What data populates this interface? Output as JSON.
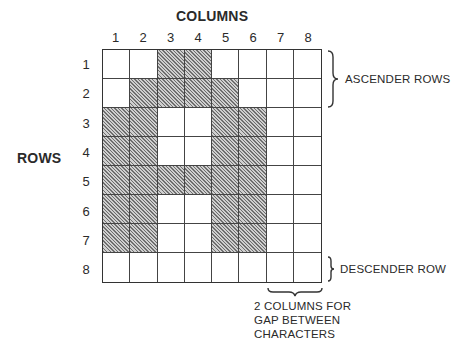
{
  "diagram": {
    "columns_title": "COLUMNS",
    "rows_title": "ROWS",
    "column_labels": [
      "1",
      "2",
      "3",
      "4",
      "5",
      "6",
      "7",
      "8"
    ],
    "row_labels": [
      "1",
      "2",
      "3",
      "4",
      "5",
      "6",
      "7",
      "8"
    ],
    "grid": {
      "rows": 8,
      "cols": 8,
      "filled_cells": [
        [
          0,
          0,
          1,
          1,
          0,
          0,
          0,
          0
        ],
        [
          0,
          1,
          1,
          1,
          1,
          0,
          0,
          0
        ],
        [
          1,
          1,
          0,
          0,
          1,
          1,
          0,
          0
        ],
        [
          1,
          1,
          0,
          0,
          1,
          1,
          0,
          0
        ],
        [
          1,
          1,
          1,
          1,
          1,
          1,
          0,
          0
        ],
        [
          1,
          1,
          0,
          0,
          1,
          1,
          0,
          0
        ],
        [
          1,
          1,
          0,
          0,
          1,
          1,
          0,
          0
        ],
        [
          0,
          0,
          0,
          0,
          0,
          0,
          0,
          0
        ]
      ],
      "fill_style": "diagonal-hatch",
      "fill_color": "#8a8a8a",
      "line_color": "#333333"
    },
    "annotations": {
      "ascender": "ASCENDER ROWS",
      "descender": "DESCENDER ROW",
      "gap_line1": "2 COLUMNS FOR",
      "gap_line2": "GAP BETWEEN",
      "gap_line3": "CHARACTERS"
    }
  }
}
